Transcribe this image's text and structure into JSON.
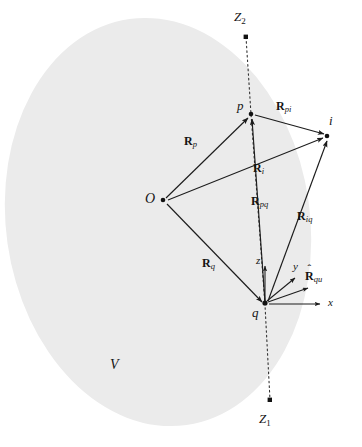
{
  "figure": {
    "type": "vector-geometry-diagram",
    "background_color": "#ffffff",
    "region_fill_color": "#ebebeb",
    "stroke_color": "#262626"
  },
  "region": {
    "label": "V",
    "shape": "ellipse",
    "center_x": 158,
    "center_y": 222,
    "radius_x": 152,
    "radius_y": 205,
    "rotation_deg": -8
  },
  "points": [
    {
      "id": "O",
      "label": "O",
      "x": 163,
      "y": 200,
      "label_x": 146,
      "label_y": 193,
      "kind": "origin"
    },
    {
      "id": "p",
      "label": "p",
      "x": 251,
      "y": 114,
      "label_x": 238,
      "label_y": 101,
      "kind": "node"
    },
    {
      "id": "i",
      "label": "i",
      "x": 327,
      "y": 136,
      "label_x": 329,
      "label_y": 116,
      "kind": "node"
    },
    {
      "id": "q",
      "label": "q",
      "x": 265,
      "y": 305,
      "label_x": 253,
      "label_y": 307,
      "kind": "node"
    },
    {
      "id": "Z2",
      "label": "Z",
      "subscript": "2",
      "x": 246,
      "y": 37,
      "label_x": 236,
      "label_y": 12,
      "kind": "axis-endpoint"
    },
    {
      "id": "Z1",
      "label": "Z",
      "subscript": "1",
      "x": 270,
      "y": 400,
      "label_x": 261,
      "label_y": 414,
      "kind": "axis-endpoint"
    }
  ],
  "vectors": [
    {
      "id": "R_p",
      "base": "R",
      "subscript": "p",
      "from": "O",
      "to": "p",
      "label_x": 190,
      "label_y": 141,
      "arrow": true
    },
    {
      "id": "R_i",
      "base": "R",
      "subscript": "i",
      "from": "O",
      "to": "i",
      "label_x": 257,
      "label_y": 167,
      "arrow": true
    },
    {
      "id": "R_q",
      "base": "R",
      "subscript": "q",
      "from": "O",
      "to": "q",
      "label_x": 206,
      "label_y": 262,
      "arrow": true
    },
    {
      "id": "R_pi",
      "base": "R",
      "subscript": "pi",
      "from": "p",
      "to": "i",
      "label_x": 278,
      "label_y": 106,
      "arrow": true
    },
    {
      "id": "R_pq",
      "base": "R",
      "subscript": "pq",
      "from": "q",
      "to": "p",
      "label_x": 255,
      "label_y": 200,
      "arrow": true
    },
    {
      "id": "R_iq",
      "base": "R",
      "subscript": "iq",
      "from": "q",
      "to": "i",
      "label_x": 301,
      "label_y": 215,
      "arrow": true
    }
  ],
  "unit_vector": {
    "id": "R_hat_qu",
    "base": "R",
    "hat": "ˆ",
    "subscript": "qu",
    "from": "q",
    "tip_x": 311,
    "tip_y": 287,
    "label_x": 308,
    "label_y": 269
  },
  "axes": [
    {
      "id": "z",
      "label": "z",
      "tip_x": 265,
      "tip_y": 264,
      "label_x": 257,
      "label_y": 259
    },
    {
      "id": "y",
      "label": "y",
      "tip_x": 297,
      "tip_y": 276,
      "label_x": 294,
      "label_y": 264
    },
    {
      "id": "x",
      "label": "x",
      "tip_x": 323,
      "tip_y": 304,
      "label_x": 329,
      "label_y": 298
    }
  ],
  "dotted_axis": {
    "id": "Z1-Z2-axis",
    "from_x": 246,
    "from_y": 37,
    "to_x": 270,
    "to_y": 400,
    "style": "dotted"
  }
}
